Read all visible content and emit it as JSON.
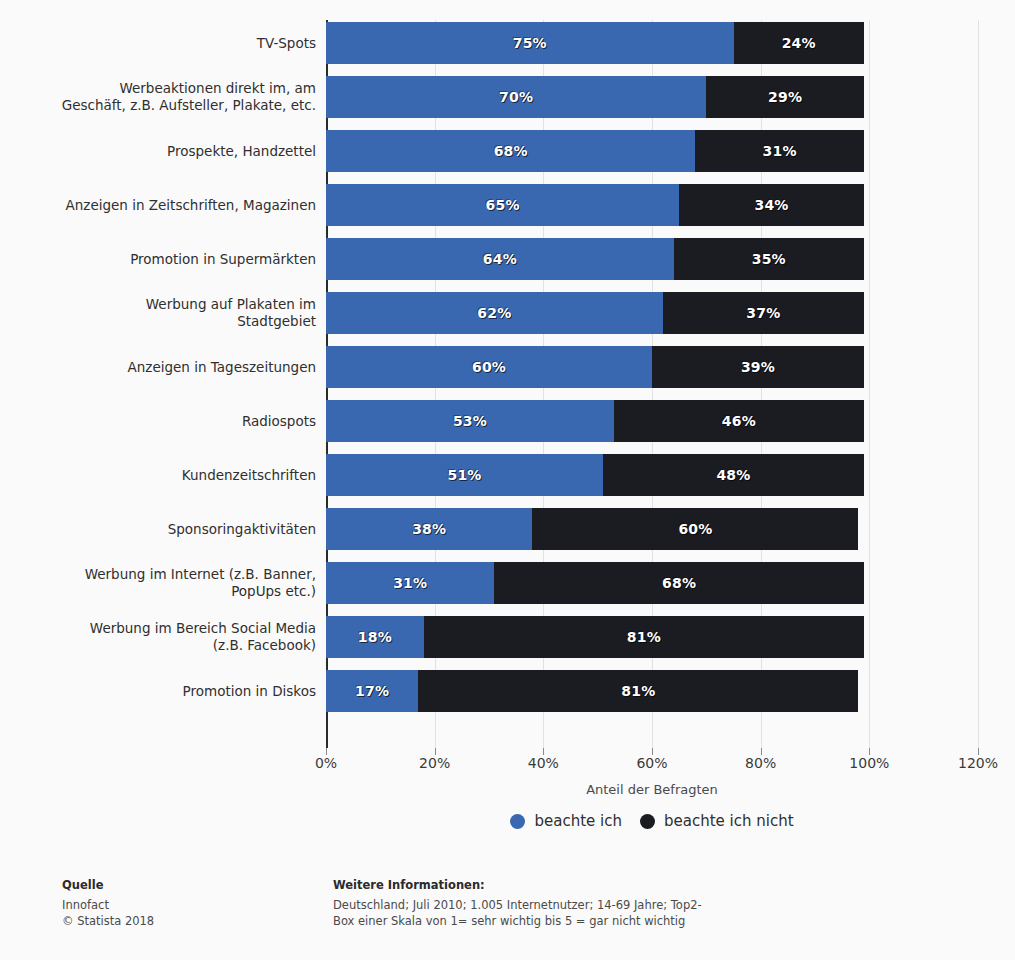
{
  "chart_data": {
    "type": "bar",
    "orientation": "horizontal",
    "stacked": true,
    "title": "",
    "xlabel": "Anteil der Befragten",
    "ylabel": "",
    "xlim": [
      0,
      120
    ],
    "xticks": [
      "0%",
      "20%",
      "40%",
      "60%",
      "80%",
      "100%",
      "120%"
    ],
    "xtick_values": [
      0,
      20,
      40,
      60,
      80,
      100,
      120
    ],
    "grid": true,
    "legend_position": "bottom",
    "categories": [
      "TV-Spots",
      "Werbeaktionen direkt im, am\nGeschäft, z.B. Aufsteller, Plakate, etc.",
      "Prospekte, Handzettel",
      "Anzeigen in Zeitschriften, Magazinen",
      "Promotion in Supermärkten",
      "Werbung auf Plakaten im\nStadtgebiet",
      "Anzeigen in Tageszeitungen",
      "Radiospots",
      "Kundenzeitschriften",
      "Sponsoringaktivitäten",
      "Werbung im Internet (z.B. Banner,\nPopUps etc.)",
      "Werbung im Bereich Social Media\n(z.B. Facebook)",
      "Promotion in Diskos"
    ],
    "series": [
      {
        "name": "beachte ich",
        "color": "#3a68b0",
        "values": [
          75,
          70,
          68,
          65,
          64,
          62,
          60,
          53,
          51,
          38,
          31,
          18,
          17
        ],
        "labels": [
          "75%",
          "70%",
          "68%",
          "65%",
          "64%",
          "62%",
          "60%",
          "53%",
          "51%",
          "38%",
          "31%",
          "18%",
          "17%"
        ]
      },
      {
        "name": "beachte ich nicht",
        "color": "#1b1b22",
        "values": [
          24,
          29,
          31,
          34,
          35,
          37,
          39,
          46,
          48,
          60,
          68,
          81,
          81
        ],
        "labels": [
          "24%",
          "29%",
          "31%",
          "34%",
          "35%",
          "37%",
          "39%",
          "46%",
          "48%",
          "60%",
          "68%",
          "81%",
          "81%"
        ]
      }
    ]
  },
  "legend": {
    "items": [
      {
        "label": "beachte ich",
        "color": "#3a68b0"
      },
      {
        "label": "beachte ich nicht",
        "color": "#1b1b22"
      }
    ]
  },
  "footer": {
    "source_heading": "Quelle",
    "source_name": "Innofact",
    "source_copyright": "© Statista 2018",
    "notes_heading": "Weitere Informationen:",
    "notes_line1": "Deutschland; Juli 2010; 1.005 Internetnutzer; 14-69 Jahre; Top2-",
    "notes_line2": "Box einer Skala von 1= sehr wichtig bis 5 = gar nicht wichtig"
  }
}
